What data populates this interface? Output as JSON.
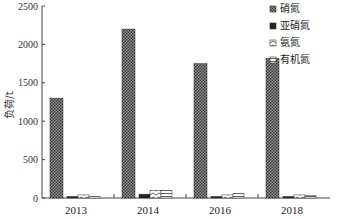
{
  "chart_data": {
    "type": "bar",
    "title": "",
    "xlabel": "",
    "ylabel": "负荷/t",
    "ylim": [
      0,
      2500
    ],
    "yticks": [
      0,
      500,
      1000,
      1500,
      2000,
      2500
    ],
    "categories": [
      "2013",
      "2014",
      "2016",
      "2018"
    ],
    "series": [
      {
        "name": "硝氮",
        "pattern": "dense-dots",
        "values": [
          1300,
          2200,
          1750,
          1820
        ]
      },
      {
        "name": "亚硝氮",
        "pattern": "solid-dark",
        "values": [
          20,
          50,
          20,
          20
        ]
      },
      {
        "name": "氨氮",
        "pattern": "wave",
        "values": [
          40,
          100,
          40,
          40
        ]
      },
      {
        "name": "有机氮",
        "pattern": "horizontal-lines",
        "values": [
          20,
          100,
          60,
          30
        ]
      }
    ],
    "legend_position": "upper-right",
    "grid": false
  }
}
